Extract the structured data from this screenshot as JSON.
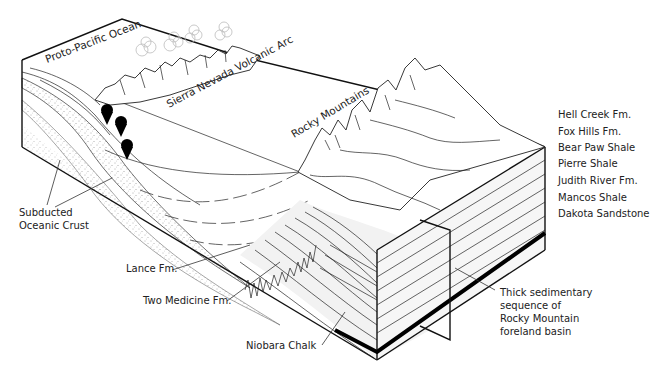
{
  "diagram": {
    "labels": {
      "ocean": "Proto-Pacific Ocean",
      "arc": "Sierra Nevada Volcanic Arc",
      "rockies": "Rocky Mountains",
      "crust_line1": "Subducted",
      "crust_line2": "Oceanic Crust",
      "lance": "Lance Fm.",
      "two_medicine": "Two Medicine Fm.",
      "niobara": "Niobara Chalk",
      "basin_line1": "Thick sedimentary",
      "basin_line2": "sequence of",
      "basin_line3": "Rocky Mountain",
      "basin_line4": "foreland basin"
    },
    "formations": [
      "Hell Creek Fm.",
      "Fox Hills Fm.",
      "Bear Paw Shale",
      "Pierre Shale",
      "Judith River Fm.",
      "Mancos Shale",
      "Dakota Sandstone"
    ],
    "colors": {
      "line": "#111111",
      "stipple": "#555555",
      "shade": "#f0f0f0",
      "cloud": "#bbbbbb",
      "marker": "#000000"
    },
    "markers_count": 3
  }
}
